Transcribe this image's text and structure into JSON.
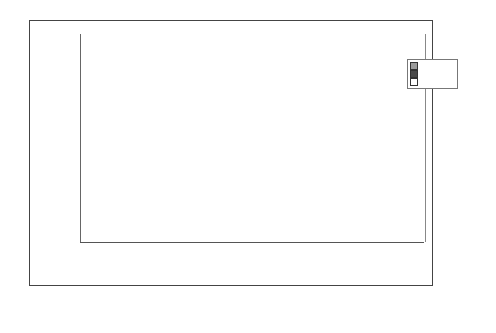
{
  "chart_data": {
    "type": "bar",
    "title": "",
    "xlabel": "",
    "ylabel": "Number of Nodes",
    "ylim": [
      0,
      300
    ],
    "yticks": [
      0,
      50,
      100,
      150,
      200,
      250,
      300
    ],
    "grid": true,
    "legend_position": "upper right (inside plot)",
    "categories": [
      "CVFDT w=1,000",
      "CVFDT w=10,000",
      "CVFDT w=100,000",
      "HAT-INC",
      "HAT-EWMA",
      "HAT-ADWIN"
    ],
    "series": [
      {
        "name": "1000",
        "color": "#9a9a9a",
        "values": [
          126,
          137,
          157,
          157,
          267,
          157
        ]
      },
      {
        "name": "10000",
        "color": "#4a4a4a",
        "values": [
          126,
          157,
          157,
          157,
          157,
          157
        ]
      },
      {
        "name": "100000",
        "color": "#ffffff",
        "values": [
          121,
          157,
          157,
          157,
          157,
          157
        ]
      }
    ]
  },
  "labels": {
    "ytitle": "Number of Nodes",
    "yticks": [
      "0",
      "50",
      "100",
      "150",
      "200",
      "250",
      "300"
    ],
    "categories": [
      [
        "CVFDT",
        "w=1,000"
      ],
      [
        "CVFDT",
        "w=10,000"
      ],
      [
        "CVFDT",
        "w=100,000"
      ],
      [
        "HAT-INC",
        ""
      ],
      [
        "HAT-EWMA",
        ""
      ],
      [
        "HAT-",
        "ADWIN"
      ]
    ],
    "legend": [
      "1000",
      "10000",
      "100000"
    ],
    "caption": "a)"
  }
}
